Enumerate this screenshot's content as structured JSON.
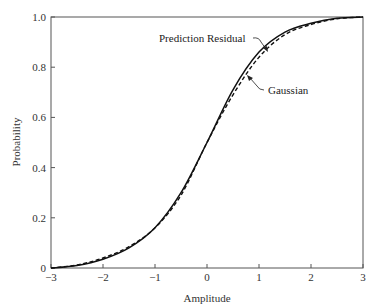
{
  "chart_data": {
    "type": "line",
    "title": "",
    "xlabel": "Amplitude",
    "ylabel": "Probability",
    "xlim": [
      -3,
      3
    ],
    "ylim": [
      0,
      1.0
    ],
    "grid": false,
    "legend_position": "none (inline annotations with arrows)",
    "x_ticks": [
      -3,
      -2,
      -1,
      0,
      1,
      2,
      3
    ],
    "x_tick_labels": [
      "−3",
      "−2",
      "−1",
      "0",
      "1",
      "2",
      "3"
    ],
    "y_ticks": [
      0,
      0.2,
      0.4,
      0.6,
      0.8,
      1.0
    ],
    "y_tick_labels": [
      "0",
      "0.2",
      "0.4",
      "0.6",
      "0.8",
      "1.0"
    ],
    "series": [
      {
        "name": "Prediction Residual",
        "style": "solid",
        "x": [
          -3,
          -2.5,
          -2,
          -1.5,
          -1,
          -0.5,
          0,
          0.5,
          1,
          1.5,
          2,
          2.5,
          3
        ],
        "values": [
          0.0,
          0.01,
          0.035,
          0.08,
          0.16,
          0.3,
          0.5,
          0.71,
          0.86,
          0.94,
          0.975,
          0.995,
          1.0
        ]
      },
      {
        "name": "Gaussian",
        "style": "dashed",
        "x": [
          -3,
          -2.5,
          -2,
          -1.5,
          -1,
          -0.5,
          0,
          0.5,
          1,
          1.5,
          2,
          2.5,
          3
        ],
        "values": [
          0.0,
          0.012,
          0.04,
          0.085,
          0.16,
          0.29,
          0.5,
          0.69,
          0.84,
          0.93,
          0.97,
          0.993,
          1.0
        ]
      }
    ],
    "annotations": [
      {
        "text": "Prediction Residual",
        "points_to": "Prediction Residual",
        "at_x": 1.1
      },
      {
        "text": "Gaussian",
        "points_to": "Gaussian",
        "at_x": 0.9
      }
    ]
  }
}
